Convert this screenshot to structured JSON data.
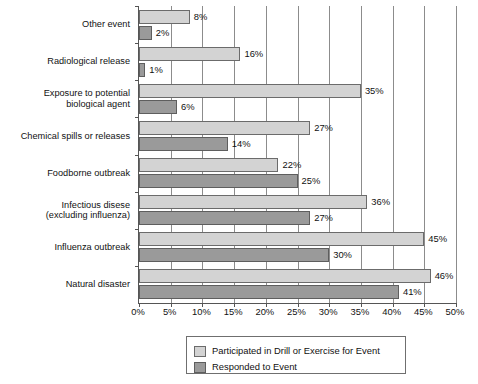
{
  "chart_data": {
    "type": "bar",
    "orientation": "horizontal",
    "title": "",
    "xlabel": "",
    "ylabel": "",
    "xlim": [
      0,
      50
    ],
    "xtick_labels": [
      "0%",
      "5%",
      "10%",
      "15%",
      "20%",
      "25%",
      "30%",
      "35%",
      "40%",
      "45%",
      "50%"
    ],
    "xticks": [
      0,
      5,
      10,
      15,
      20,
      25,
      30,
      35,
      40,
      45,
      50
    ],
    "grid": "vertical",
    "legend_position": "bottom-center",
    "categories": [
      "Other event",
      "Radiological release",
      "Exposure to potential\nbiological agent",
      "Chemical spills or releases",
      "Foodborne outbreak",
      "Infectious disese\n(excluding influenza)",
      "Influenza outbreak",
      "Natural disaster"
    ],
    "series": [
      {
        "name": "Participated in Drill or Exercise for Event",
        "color": "#d3d3d3",
        "values": [
          8,
          16,
          35,
          27,
          22,
          36,
          45,
          46
        ],
        "labels": [
          "8%",
          "16%",
          "35%",
          "27%",
          "22%",
          "36%",
          "45%",
          "46%"
        ]
      },
      {
        "name": "Responded to Event",
        "color": "#9a9a9a",
        "values": [
          2,
          1,
          6,
          14,
          25,
          27,
          30,
          41
        ],
        "labels": [
          "2%",
          "1%",
          "6%",
          "14%",
          "25%",
          "27%",
          "30%",
          "41%"
        ]
      }
    ]
  },
  "legend": {
    "items": [
      {
        "label": "Participated in Drill or Exercise for Event",
        "color": "#d3d3d3"
      },
      {
        "label": "Responded to Event",
        "color": "#9a9a9a"
      }
    ]
  }
}
